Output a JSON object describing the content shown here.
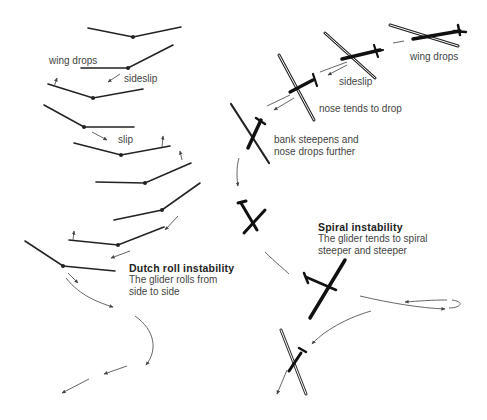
{
  "labels": {
    "dutch_wing_drops": "wing drops",
    "dutch_sideslip": "sideslip",
    "dutch_slip": "slip",
    "spiral_wing_drops": "wing drops",
    "spiral_sideslip": "sideslip",
    "spiral_nose_tends": "nose tends to drop",
    "spiral_bank_1": "bank steepens and",
    "spiral_bank_2": "nose drops further"
  },
  "dutch_roll": {
    "title": "Dutch roll instability",
    "line1": "The glider rolls from",
    "line2": "side to side"
  },
  "spiral": {
    "title": "Spiral instability",
    "line1": "The glider tends to spiral",
    "line2": "steeper and steeper"
  },
  "colors": {
    "ink": "#222222",
    "arrow": "#555555",
    "text": "#444444"
  }
}
